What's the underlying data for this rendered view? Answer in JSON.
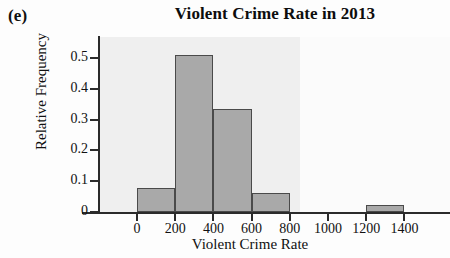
{
  "panel_label": "(e)",
  "chart_data": {
    "type": "bar",
    "title": "Violent Crime Rate in 2013",
    "xlabel": "Violent Crime Rate",
    "ylabel": "Relative Frequency",
    "xlim": [
      -120,
      1560
    ],
    "ylim": [
      0,
      0.55
    ],
    "grid": false,
    "legend": null,
    "bin_width": 200,
    "bin_edges": [
      0,
      200,
      400,
      600,
      800,
      1000,
      1200,
      1400
    ],
    "categories": [
      "0-200",
      "200-400",
      "400-600",
      "600-800",
      "800-1000",
      "1000-1200",
      "1200-1400"
    ],
    "values": [
      0.078,
      0.51,
      0.334,
      0.062,
      0,
      0,
      0.022
    ],
    "xticks": [
      0,
      200,
      400,
      600,
      800,
      1000,
      1200,
      1400
    ],
    "xtick_labels": [
      "0",
      "200",
      "400",
      "600",
      "800",
      "1000",
      "1200",
      "1400"
    ],
    "yticks": [
      0,
      0.1,
      0.2,
      0.3,
      0.4,
      0.5
    ],
    "ytick_labels": [
      "0",
      "0.1",
      "0.2",
      "0.3",
      "0.4",
      "0.5"
    ],
    "bar_fill_color": "#a9a9a9",
    "bar_edge_color": "#4a4a4a",
    "panel_color": "#efefef",
    "axis_color": "#2b2b2b"
  }
}
